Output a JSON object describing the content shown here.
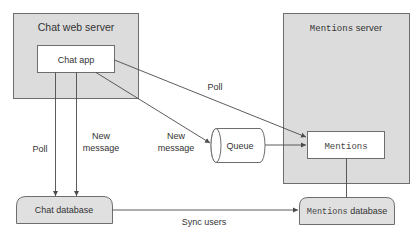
{
  "diagram": {
    "chat_server": {
      "title": "Chat web server"
    },
    "chat_app": {
      "label": "Chat app"
    },
    "mentions_server": {
      "title_code": "Mentions",
      "title_text": " server"
    },
    "mentions_app": {
      "label": "Mentions"
    },
    "queue": {
      "label": "Queue"
    },
    "chat_db": {
      "label": "Chat database"
    },
    "mentions_db": {
      "label_code": "Mentions",
      "label_text": " database"
    },
    "edges": {
      "poll_left": "Poll",
      "new_message_left_1": "New",
      "new_message_left_2": "message",
      "new_message_queue_1": "New",
      "new_message_queue_2": "message",
      "poll_mentions": "Poll",
      "sync_users": "Sync users"
    },
    "colors": {
      "server_fill": "#dcdcdc",
      "box_fill": "#ffffff",
      "db_fill": "#e0e0e0",
      "stroke": "#6e6e6e",
      "text": "#333333"
    }
  }
}
